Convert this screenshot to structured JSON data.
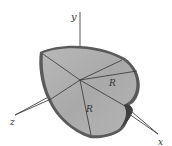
{
  "figure": {
    "axes": {
      "x_label": "x",
      "y_label": "y",
      "z_label": "z"
    },
    "dimension_labels": {
      "radius_1": "R",
      "radius_2": "R"
    },
    "colors": {
      "shell_fill": "#a8a8a8",
      "shell_light": "#c4c4c4",
      "rim": "#555555",
      "axis": "#444444",
      "background": "#ffffff"
    }
  }
}
